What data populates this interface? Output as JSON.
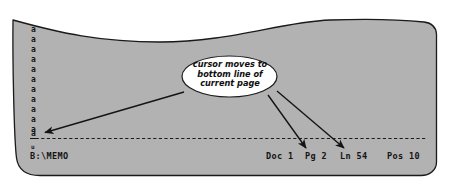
{
  "figure": {
    "type": "annotated-screenshot-illustration"
  },
  "colors": {
    "screen_fill": "#b2b2b2",
    "screen_border": "#1a1a1a",
    "page_background": "#ffffff",
    "text": "#141414",
    "callout_fill": "#ffffff",
    "callout_border": "#1a1a1a",
    "arrow": "#141414",
    "dashed_line": "#1a1a1a"
  },
  "screen": {
    "document_chars": [
      "a",
      "a",
      "a",
      "a",
      "a",
      "a",
      "a",
      "a",
      "a",
      "a",
      "a"
    ],
    "cursor_char": "a",
    "trailing_char": "u"
  },
  "callout": {
    "line1": "cursor moves to",
    "line2": "bottom line of",
    "line3": "current page"
  },
  "status_bar": {
    "filename": "B:\\MEMO",
    "doc": "Doc 1",
    "page": "Pg 2",
    "line": "Ln 54",
    "position": "Pos 10"
  },
  "arrows": [
    {
      "name": "arrow-to-cursor",
      "target": "cursor_char"
    },
    {
      "name": "arrow-to-page",
      "target": "Pg 2"
    },
    {
      "name": "arrow-to-line",
      "target": "Ln 54"
    }
  ]
}
